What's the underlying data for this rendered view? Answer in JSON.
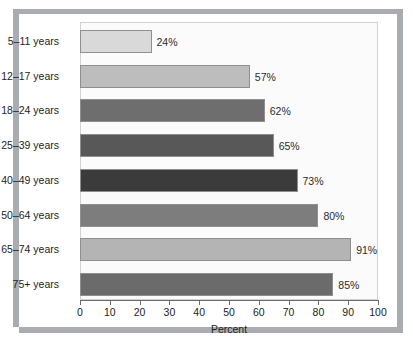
{
  "chart_data": {
    "type": "bar",
    "orientation": "horizontal",
    "title": "",
    "xlabel": "Percent",
    "ylabel": "",
    "xlim": [
      0,
      100
    ],
    "xticks": [
      "0",
      "10",
      "20",
      "30",
      "40",
      "50",
      "60",
      "70",
      "80",
      "90",
      "100"
    ],
    "grid": false,
    "legend": null,
    "categories": [
      "5–11 years",
      "12–17 years",
      "18–24 years",
      "25–39 years",
      "40–49 years",
      "50–64 years",
      "65–74 years",
      "75+ years"
    ],
    "values": [
      24,
      57,
      62,
      65,
      73,
      80,
      91,
      85
    ],
    "value_labels": [
      "24%",
      "57%",
      "62%",
      "65%",
      "73%",
      "80%",
      "91%",
      "85%"
    ],
    "bar_colors": [
      "#d9d9d9",
      "#bdbdbd",
      "#6e6e6e",
      "#585858",
      "#3b3b3b",
      "#7d7d7d",
      "#b4b4b4",
      "#6b6b6b"
    ]
  },
  "figure": {
    "panel_background": "#ffffff",
    "frame_shadow_color": "#a9adb2",
    "plot_background": "#fbfbfb",
    "axis_color": "#6b6b6b"
  }
}
